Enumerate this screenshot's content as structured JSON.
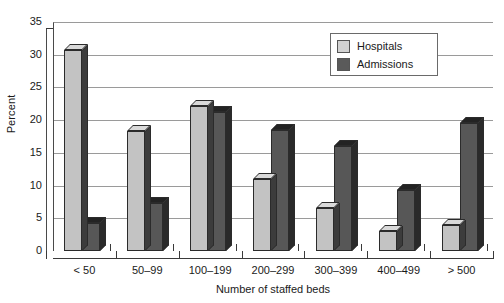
{
  "chart_data": {
    "type": "bar",
    "title": "",
    "xlabel": "Number of staffed beds",
    "ylabel": "Percent",
    "ylim": [
      0,
      35
    ],
    "yticks": [
      0,
      5,
      10,
      15,
      20,
      25,
      30,
      35
    ],
    "grid": true,
    "legend_position": "top-right",
    "style": "3d-clustered-column",
    "categories": [
      "< 50",
      "50–99",
      "100–199",
      "200–299",
      "300–399",
      "400–499",
      "> 500"
    ],
    "series": [
      {
        "name": "Hospitals",
        "color": "#c3c3c3",
        "values": [
          30.7,
          18.3,
          22.2,
          11.0,
          6.5,
          3.0,
          4.0
        ]
      },
      {
        "name": "Admissions",
        "color": "#575757",
        "values": [
          4.3,
          7.3,
          21.2,
          18.5,
          16.0,
          9.3,
          19.5
        ]
      }
    ]
  },
  "axis": {
    "y_title": "Percent",
    "x_title": "Number of staffed beds",
    "y_tick_labels": [
      "35",
      "30",
      "25",
      "20",
      "15",
      "10",
      "5",
      "0"
    ]
  },
  "legend": {
    "items": [
      {
        "label": "Hospitals",
        "swatch": "hospitals"
      },
      {
        "label": "Admissions",
        "swatch": "admissions"
      }
    ]
  }
}
